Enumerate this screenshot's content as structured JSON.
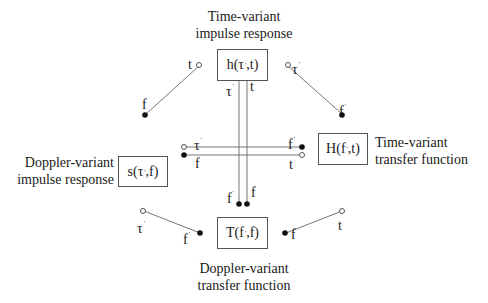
{
  "diagram": {
    "title": "",
    "nodes": {
      "top": {
        "function": "h(τ',t)",
        "fn_base": "h(τ",
        "fn_rest": ",t)",
        "caption_line1": "Time-variant",
        "caption_line2": "impulse response"
      },
      "left": {
        "function": "s(τ',f)",
        "fn_base": "s(τ",
        "fn_rest": ",f)",
        "caption_line1": "Doppler-variant",
        "caption_line2": "impulse response"
      },
      "right": {
        "function": "H(f',t)",
        "fn_base": "H(f",
        "fn_rest": ",t)",
        "caption_line1": "Time-variant",
        "caption_line2": "transfer function"
      },
      "bottom": {
        "function": "T(f',f)",
        "fn_base": "T(f",
        "fn_rest": ",f)",
        "caption_line1": "Doppler-variant",
        "caption_line2": "transfer function"
      }
    },
    "prime": "'",
    "connectors": {
      "top_left": {
        "open_label": "t",
        "filled_label": "f"
      },
      "top_right": {
        "open_label": "τ",
        "open_prime": true,
        "filled_label": "f",
        "filled_prime": true
      },
      "bottom_left": {
        "open_label": "τ",
        "open_prime": true,
        "filled_label": "f",
        "filled_prime": true
      },
      "bottom_right": {
        "open_label": "t",
        "filled_label": "f"
      },
      "vertical_left": {
        "open_label": "τ",
        "open_prime": true,
        "filled_label": "f",
        "filled_prime": true
      },
      "vertical_right": {
        "open_label": "t",
        "filled_label": "f"
      },
      "horizontal_top": {
        "left_open_label": "τ",
        "left_prime": true,
        "right_filled_label": "f",
        "right_prime": true
      },
      "horizontal_bottom": {
        "left_filled_label": "f",
        "right_open_label": "t"
      }
    },
    "legend": {
      "open_circle": "time/delay variable",
      "filled_circle": "frequency variable"
    },
    "line_color": "#666666",
    "dot_color": "#111111"
  }
}
